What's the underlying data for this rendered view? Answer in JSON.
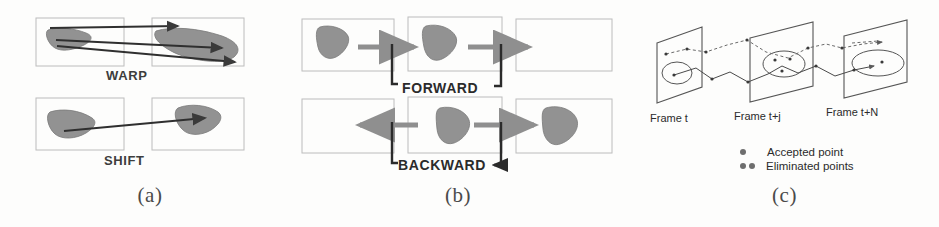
{
  "figure": {
    "width": 939,
    "height": 227,
    "background": "#fdfdfc"
  },
  "panels": [
    {
      "id": "a",
      "caption": "(a)",
      "labels": {
        "warp": "WARP",
        "shift": "SHIFT"
      },
      "description": "Two stacked pairs of image rectangles. Top pair labelled WARP has three correspondence arrows between a gray blob in the left frame and a warped gray blob in the right frame. Bottom pair labelled SHIFT has a single translation arrow between the two blobs."
    },
    {
      "id": "b",
      "caption": "(b)",
      "labels": {
        "forward": "FORWARD",
        "backward": "BACKWARD"
      },
      "description": "Two rows of three overlapping frame rectangles. Top row FORWARD: gray arrows point right, propagating the blob from frame to frame. Bottom row BACKWARD: a gray arrow points left and another points right, with elbow connectors descending to the label."
    },
    {
      "id": "c",
      "caption": "(c)",
      "frames": [
        {
          "label": "Frame t"
        },
        {
          "label": "Frame t+j"
        },
        {
          "label": "Frame t+N"
        }
      ],
      "legend": [
        {
          "marker": "single-dot",
          "label": "Accepted point"
        },
        {
          "marker": "double-dot",
          "label": "Eliminated points"
        }
      ],
      "description": "Three receding parallelogram image planes drawn in perspective, each containing an ellipse region. Dashed and solid polylines trace feature points across the planes."
    }
  ],
  "colors": {
    "blob_fill": "#8a8a8a",
    "blob_stroke": "#6f6f6f",
    "frame_stroke": "#b9b9b9",
    "arrow_gray": "#8f8f8f",
    "arrow_dark": "#2b2b2b",
    "plane_stroke": "#555555",
    "track_dashed": "#6a6a6a",
    "track_solid": "#4a4a4a",
    "text": "#2b2b2b",
    "caption_text": "#4a4a4a",
    "background": "#fdfdfc"
  }
}
